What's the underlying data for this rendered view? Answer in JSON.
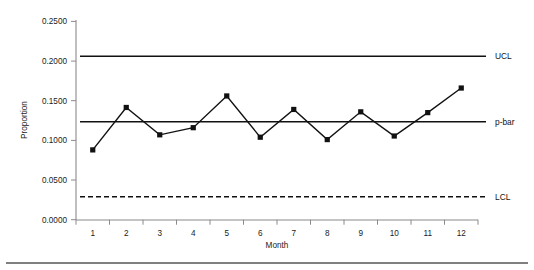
{
  "chart_data": {
    "type": "line",
    "title": "",
    "subtitle": "",
    "xlabel": "Month",
    "ylabel": "Proportion",
    "categories": [
      "1",
      "2",
      "3",
      "4",
      "5",
      "6",
      "7",
      "8",
      "9",
      "10",
      "11",
      "12"
    ],
    "x": [
      1,
      2,
      3,
      4,
      5,
      6,
      7,
      8,
      9,
      10,
      11,
      12
    ],
    "series": [
      {
        "name": "Proportion",
        "values": [
          0.088,
          0.1415,
          0.107,
          0.116,
          0.156,
          0.104,
          0.139,
          0.101,
          0.136,
          0.1055,
          0.135,
          0.166
        ],
        "marker": "square",
        "color": "#111111"
      }
    ],
    "reference_lines": [
      {
        "label": "UCL",
        "value": 0.206,
        "style": "solid",
        "color": "#111111"
      },
      {
        "label": "p-bar",
        "value": 0.1235,
        "style": "solid",
        "color": "#111111"
      },
      {
        "label": "LCL",
        "value": 0.029,
        "style": "dashed",
        "color": "#111111"
      }
    ],
    "ylim": [
      0.0,
      0.25
    ],
    "xlim": [
      0.5,
      12.5
    ],
    "yticks": [
      0.0,
      0.05,
      0.1,
      0.15,
      0.2,
      0.25
    ],
    "ytick_labels": [
      "0.0000",
      "0.0500",
      "0.1000",
      "0.1500",
      "0.2000",
      "0.2500"
    ],
    "xtick_labels": [
      "1",
      "2",
      "3",
      "4",
      "5",
      "6",
      "7",
      "8",
      "9",
      "10",
      "11",
      "12"
    ],
    "grid": false,
    "legend": "none"
  },
  "axes": {
    "y_title": "Proportion",
    "x_title": "Month"
  },
  "limits": {
    "ucl_label": "UCL",
    "pbar_label": "p-bar",
    "lcl_label": "LCL"
  }
}
